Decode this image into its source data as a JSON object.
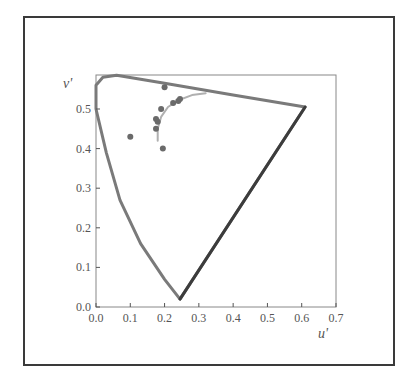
{
  "chart_data": {
    "type": "scatter",
    "title": "",
    "xlabel": "u'",
    "ylabel": "v'",
    "xlim": [
      0.0,
      0.7
    ],
    "ylim": [
      0.0,
      0.58
    ],
    "x_ticks": [
      "0.0",
      "0.1",
      "0.2",
      "0.3",
      "0.4",
      "0.5",
      "0.6",
      "0.7"
    ],
    "y_ticks": [
      "0.0",
      "0.1",
      "0.2",
      "0.3",
      "0.4",
      "0.5"
    ],
    "grid": false,
    "legend": null,
    "series": [
      {
        "name": "spectral-locus",
        "kind": "line",
        "points": [
          [
            0.0,
            0.5
          ],
          [
            0.0,
            0.56
          ],
          [
            0.02,
            0.58
          ],
          [
            0.06,
            0.585
          ],
          [
            0.2,
            0.565
          ],
          [
            0.4,
            0.535
          ],
          [
            0.61,
            0.505
          ],
          [
            0.245,
            0.02
          ],
          [
            0.2,
            0.07
          ],
          [
            0.13,
            0.16
          ],
          [
            0.07,
            0.27
          ],
          [
            0.03,
            0.39
          ],
          [
            0.0,
            0.5
          ]
        ]
      },
      {
        "name": "planckian-locus",
        "kind": "line",
        "points": [
          [
            0.18,
            0.42
          ],
          [
            0.18,
            0.45
          ],
          [
            0.19,
            0.48
          ],
          [
            0.21,
            0.505
          ],
          [
            0.24,
            0.522
          ],
          [
            0.28,
            0.535
          ],
          [
            0.32,
            0.54
          ]
        ]
      },
      {
        "name": "measured-points",
        "kind": "scatter",
        "points": [
          [
            0.1,
            0.43
          ],
          [
            0.195,
            0.4
          ],
          [
            0.2,
            0.555
          ],
          [
            0.19,
            0.5
          ],
          [
            0.175,
            0.475
          ],
          [
            0.18,
            0.468
          ],
          [
            0.175,
            0.45
          ],
          [
            0.225,
            0.515
          ],
          [
            0.24,
            0.52
          ],
          [
            0.245,
            0.525
          ]
        ]
      }
    ]
  },
  "axes": {
    "x_label": "u'",
    "y_label": "v'"
  },
  "colors": {
    "locus": "#7a7a7a",
    "locus_dark": "#3c3c3c",
    "planckian": "#b0b0b0",
    "points": "#6a6a6a",
    "axis": "#555555",
    "frame": "#3a3a3a"
  }
}
